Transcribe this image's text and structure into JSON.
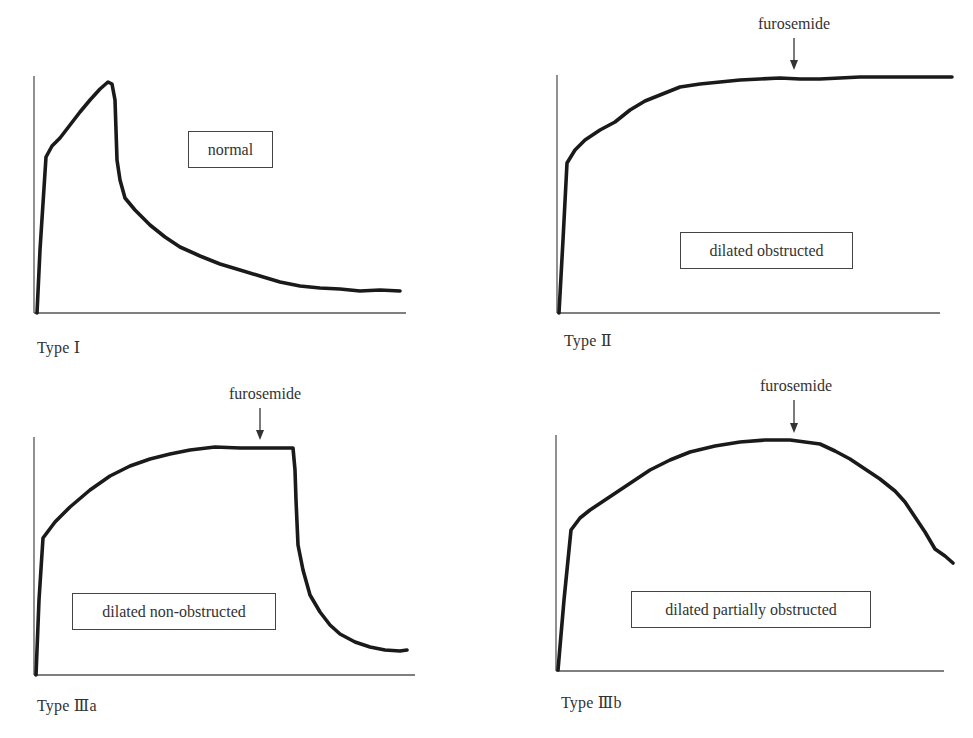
{
  "figure": {
    "panels": [
      {
        "id": "type-1",
        "label": "Type Ⅰ",
        "category": "normal",
        "furosemide": null
      },
      {
        "id": "type-2",
        "label": "Type Ⅱ",
        "category": "dilated obstructed",
        "furosemide": "furosemide"
      },
      {
        "id": "type-3a",
        "label": "Type Ⅲa",
        "category": "dilated non-obstructed",
        "furosemide": "furosemide"
      },
      {
        "id": "type-3b",
        "label": "Type Ⅲb",
        "category": "dilated partially obstructed",
        "furosemide": "furosemide"
      }
    ]
  },
  "chart_data": [
    {
      "type": "line",
      "title": "Type Ⅰ",
      "annotation_box": "normal",
      "xlabel": "",
      "ylabel": "",
      "axes_px": {
        "x0": 34,
        "y0": 313,
        "x1": 406,
        "ytop": 76
      },
      "curve_px": [
        [
          37,
          313
        ],
        [
          40,
          250
        ],
        [
          46,
          157
        ],
        [
          52,
          146
        ],
        [
          60,
          138
        ],
        [
          70,
          125
        ],
        [
          80,
          112
        ],
        [
          90,
          100
        ],
        [
          100,
          89
        ],
        [
          108,
          82
        ],
        [
          112,
          84
        ],
        [
          115,
          100
        ],
        [
          116,
          130
        ],
        [
          117,
          160
        ],
        [
          120,
          180
        ],
        [
          125,
          198
        ],
        [
          135,
          210
        ],
        [
          150,
          225
        ],
        [
          165,
          237
        ],
        [
          180,
          247
        ],
        [
          200,
          256
        ],
        [
          220,
          264
        ],
        [
          240,
          270
        ],
        [
          260,
          276
        ],
        [
          280,
          282
        ],
        [
          300,
          286
        ],
        [
          320,
          288
        ],
        [
          340,
          289
        ],
        [
          360,
          291
        ],
        [
          380,
          290
        ],
        [
          400,
          291
        ]
      ],
      "furosemide_marker_px": null
    },
    {
      "type": "line",
      "title": "Type Ⅱ",
      "annotation_box": "dilated obstructed",
      "xlabel": "",
      "ylabel": "",
      "axes_px": {
        "x0": 557,
        "y0": 313,
        "x1": 940,
        "ytop": 75
      },
      "curve_px": [
        [
          559,
          313
        ],
        [
          563,
          240
        ],
        [
          567,
          163
        ],
        [
          575,
          150
        ],
        [
          585,
          140
        ],
        [
          600,
          130
        ],
        [
          615,
          122
        ],
        [
          630,
          110
        ],
        [
          645,
          101
        ],
        [
          660,
          95
        ],
        [
          680,
          87
        ],
        [
          700,
          84
        ],
        [
          720,
          82
        ],
        [
          740,
          80
        ],
        [
          760,
          79
        ],
        [
          780,
          78
        ],
        [
          800,
          79
        ],
        [
          820,
          79
        ],
        [
          840,
          78
        ],
        [
          860,
          77
        ],
        [
          880,
          77
        ],
        [
          900,
          77
        ],
        [
          920,
          77
        ],
        [
          940,
          77
        ],
        [
          952,
          77
        ]
      ],
      "furosemide_marker_px": {
        "x": 794,
        "text_y": 25,
        "arrow_y1": 38,
        "arrow_y2": 70
      }
    },
    {
      "type": "line",
      "title": "Type Ⅲa",
      "annotation_box": "dilated non-obstructed",
      "xlabel": "",
      "ylabel": "",
      "axes_px": {
        "x0": 34,
        "y0": 675,
        "x1": 415,
        "ytop": 437
      },
      "curve_px": [
        [
          36,
          675
        ],
        [
          39,
          600
        ],
        [
          43,
          538
        ],
        [
          55,
          522
        ],
        [
          70,
          507
        ],
        [
          90,
          490
        ],
        [
          110,
          476
        ],
        [
          130,
          466
        ],
        [
          150,
          459
        ],
        [
          170,
          454
        ],
        [
          190,
          450
        ],
        [
          215,
          447
        ],
        [
          240,
          448
        ],
        [
          260,
          448
        ],
        [
          280,
          448
        ],
        [
          293,
          448
        ],
        [
          295,
          470
        ],
        [
          296,
          500
        ],
        [
          298,
          545
        ],
        [
          303,
          570
        ],
        [
          310,
          595
        ],
        [
          320,
          612
        ],
        [
          330,
          625
        ],
        [
          340,
          634
        ],
        [
          355,
          642
        ],
        [
          370,
          647
        ],
        [
          385,
          650
        ],
        [
          400,
          651
        ],
        [
          407,
          650
        ]
      ],
      "furosemide_marker_px": {
        "x": 260,
        "text_y": 395,
        "arrow_y1": 408,
        "arrow_y2": 440
      }
    },
    {
      "type": "line",
      "title": "Type Ⅲb",
      "annotation_box": "dilated partially obstructed",
      "xlabel": "",
      "ylabel": "",
      "axes_px": {
        "x0": 556,
        "y0": 671,
        "x1": 944,
        "ytop": 435
      },
      "curve_px": [
        [
          558,
          670
        ],
        [
          564,
          600
        ],
        [
          571,
          530
        ],
        [
          580,
          518
        ],
        [
          590,
          510
        ],
        [
          605,
          500
        ],
        [
          620,
          490
        ],
        [
          635,
          480
        ],
        [
          650,
          470
        ],
        [
          670,
          460
        ],
        [
          690,
          452
        ],
        [
          715,
          446
        ],
        [
          740,
          442
        ],
        [
          765,
          440
        ],
        [
          790,
          440
        ],
        [
          805,
          442
        ],
        [
          820,
          444
        ],
        [
          835,
          451
        ],
        [
          850,
          459
        ],
        [
          865,
          469
        ],
        [
          880,
          479
        ],
        [
          895,
          491
        ],
        [
          905,
          502
        ],
        [
          915,
          517
        ],
        [
          925,
          532
        ],
        [
          935,
          549
        ],
        [
          945,
          556
        ],
        [
          953,
          563
        ]
      ],
      "furosemide_marker_px": {
        "x": 794,
        "text_y": 387,
        "arrow_y1": 400,
        "arrow_y2": 433
      }
    }
  ]
}
